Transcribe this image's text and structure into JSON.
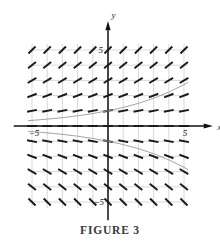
{
  "figure": {
    "caption": "FIGURE 3",
    "kind": "slope-field"
  },
  "axes": {
    "x_axis_label": "x",
    "y_axis_label": "y",
    "x_tick_left_label": "−5",
    "x_tick_right_label": "5",
    "y_tick_top_label": "5",
    "y_tick_bottom_label": "−5",
    "color": "#101010",
    "grid_color": "#c9c9c9"
  },
  "chart_data": {
    "type": "scatter",
    "title": "FIGURE 3",
    "xlabel": "x",
    "ylabel": "y",
    "xlim": [
      -6,
      6
    ],
    "ylim": [
      -6,
      6
    ],
    "grid": true,
    "legend": "none",
    "x_ticks": [
      -5,
      5
    ],
    "y_ticks": [
      -5,
      5
    ],
    "slope_field": {
      "x": [
        -5,
        -4,
        -3,
        -2,
        -1,
        0,
        1,
        2,
        3,
        4,
        5
      ],
      "y": [
        5,
        4,
        3,
        2,
        1,
        0,
        -1,
        -2,
        -3,
        -4,
        -5
      ],
      "rule": "slope = y/5",
      "slopes_by_y": [
        1.0,
        0.8,
        0.6,
        0.4,
        0.2,
        0.0,
        -0.2,
        -0.4,
        -0.6,
        -0.8,
        -1.0
      ],
      "segment_color": "#1a1a1a"
    },
    "series": [
      {
        "name": "upper-solution-curve",
        "color": "#9a9a9a",
        "points": [
          [
            -6.0,
            0.3
          ],
          [
            -5.0,
            0.37
          ],
          [
            -4.0,
            0.45
          ],
          [
            -3.0,
            0.55
          ],
          [
            -2.0,
            0.67
          ],
          [
            -1.0,
            0.82
          ],
          [
            0.0,
            1.0
          ],
          [
            1.0,
            1.22
          ],
          [
            2.0,
            1.49
          ],
          [
            3.0,
            1.82
          ],
          [
            4.0,
            2.23
          ],
          [
            5.0,
            2.72
          ],
          [
            6.0,
            3.32
          ],
          [
            7.0,
            4.06
          ]
        ]
      },
      {
        "name": "lower-solution-curve",
        "color": "#9a9a9a",
        "points": [
          [
            -6.0,
            -0.3
          ],
          [
            -5.0,
            -0.37
          ],
          [
            -4.0,
            -0.45
          ],
          [
            -3.0,
            -0.55
          ],
          [
            -2.0,
            -0.67
          ],
          [
            -1.0,
            -0.82
          ],
          [
            0.0,
            -1.0
          ],
          [
            1.0,
            -1.22
          ],
          [
            2.0,
            -1.49
          ],
          [
            3.0,
            -1.82
          ],
          [
            4.0,
            -2.23
          ],
          [
            5.0,
            -2.72
          ],
          [
            6.0,
            -3.32
          ],
          [
            7.0,
            -4.06
          ]
        ]
      }
    ]
  }
}
